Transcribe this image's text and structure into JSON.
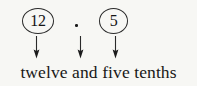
{
  "figure": {
    "name": "decimal-place-value-diagram",
    "background_color": "#f7f7f4",
    "ink_color": "#1a1a1a",
    "number_shown": "12.5",
    "tokens": [
      {
        "id": "whole",
        "label": "12",
        "circled": true
      },
      {
        "id": "point",
        "label": ".",
        "circled": false
      },
      {
        "id": "tenths",
        "label": "5",
        "circled": true
      }
    ],
    "arrows": [
      {
        "id": "whole",
        "direction": "down"
      },
      {
        "id": "point",
        "direction": "down"
      },
      {
        "id": "tenths",
        "direction": "down"
      }
    ],
    "words": "twelve and five tenths"
  }
}
